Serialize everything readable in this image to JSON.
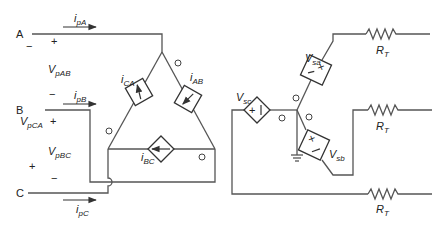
{
  "diagram": {
    "nodes": {
      "A": "A",
      "B": "B",
      "C": "C"
    },
    "currents": {
      "ipA": {
        "main": "i",
        "sub": "pA"
      },
      "ipB": {
        "main": "i",
        "sub": "pB"
      },
      "ipC": {
        "main": "i",
        "sub": "pC"
      },
      "iCA": {
        "main": "i",
        "sub": "CA"
      },
      "iAB": {
        "main": "i",
        "sub": "AB"
      },
      "iBC": {
        "main": "i",
        "sub": "BC"
      }
    },
    "voltages": {
      "VpAB": {
        "main": "V",
        "sub": "pAB"
      },
      "VpCA": {
        "main": "V",
        "sub": "pCA"
      },
      "VpBC": {
        "main": "V",
        "sub": "pBC"
      },
      "Vsa": {
        "main": "V",
        "sub": "sa"
      },
      "Vsb": {
        "main": "V",
        "sub": "sb"
      },
      "Vsc": {
        "main": "V",
        "sub": "sc"
      }
    },
    "resistors": [
      {
        "main": "R",
        "sub": "T"
      },
      {
        "main": "R",
        "sub": "T"
      },
      {
        "main": "R",
        "sub": "T"
      }
    ],
    "polarity": {
      "plus": "+",
      "minus": "−"
    },
    "source_glyphs": {
      "vsc": "+ |",
      "vsa": "×",
      "vsb": "×"
    },
    "polarity_marks": {
      "dot": "o"
    },
    "colors": {
      "wire": "#555555",
      "component": "#333333",
      "text": "#222222",
      "background": "#ffffff"
    }
  }
}
